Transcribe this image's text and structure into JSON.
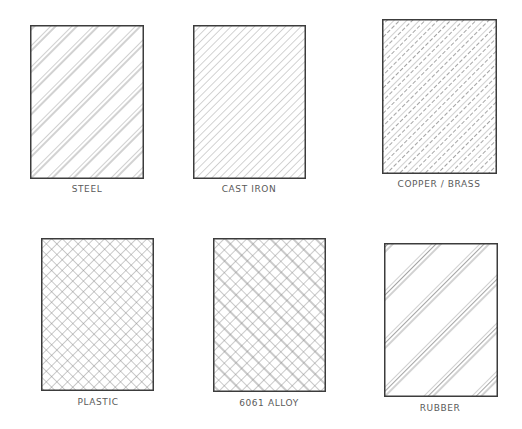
{
  "colors": {
    "border": "#3c3c3c",
    "hatch": "#9a9a9a",
    "label": "#5a5a5a",
    "background": "#ffffff"
  },
  "swatches": [
    {
      "id": "steel",
      "label": "STEEL",
      "pattern": "paired-diagonal-lines",
      "box": [
        30,
        25,
        113,
        153
      ],
      "label_pos": [
        87,
        190
      ]
    },
    {
      "id": "castiron",
      "label": "CAST IRON",
      "pattern": "uniform-diagonal-lines",
      "box": [
        193,
        25,
        112,
        153
      ],
      "label_pos": [
        249,
        190
      ]
    },
    {
      "id": "copper",
      "label": "COPPER / BRASS",
      "pattern": "alternating-solid-dashed-lines",
      "box": [
        382,
        19,
        114,
        154
      ],
      "label_pos": [
        439,
        185
      ]
    },
    {
      "id": "plastic",
      "label": "PLASTIC",
      "pattern": "diagonal-crosshatch",
      "box": [
        41,
        238,
        112,
        152
      ],
      "label_pos": [
        98,
        403
      ]
    },
    {
      "id": "alloy",
      "label": "6061 ALLOY",
      "pattern": "diagonal-brick-weave",
      "box": [
        213,
        238,
        112,
        153
      ],
      "label_pos": [
        269,
        404
      ]
    },
    {
      "id": "rubber",
      "label": "RUBBER",
      "pattern": "grouped-triple-diagonal-lines",
      "box": [
        384,
        243,
        113,
        153
      ],
      "label_pos": [
        440,
        409
      ]
    }
  ]
}
